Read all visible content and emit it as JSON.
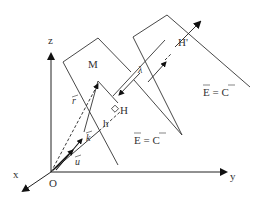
{
  "diagram": {
    "title": "",
    "axes": {
      "x": "x",
      "y": "y",
      "z": "z",
      "origin": "O"
    },
    "points": {
      "M": "M",
      "H": "H",
      "H_prime": "H'",
      "h": "h"
    },
    "vectors": {
      "r": "r",
      "k": "k",
      "u": "u"
    },
    "wavelength": "λ",
    "plane_label_1": "E = C",
    "plane_label_2": "E = C",
    "colors": {
      "stroke": "#222222",
      "text": "#333333"
    }
  }
}
